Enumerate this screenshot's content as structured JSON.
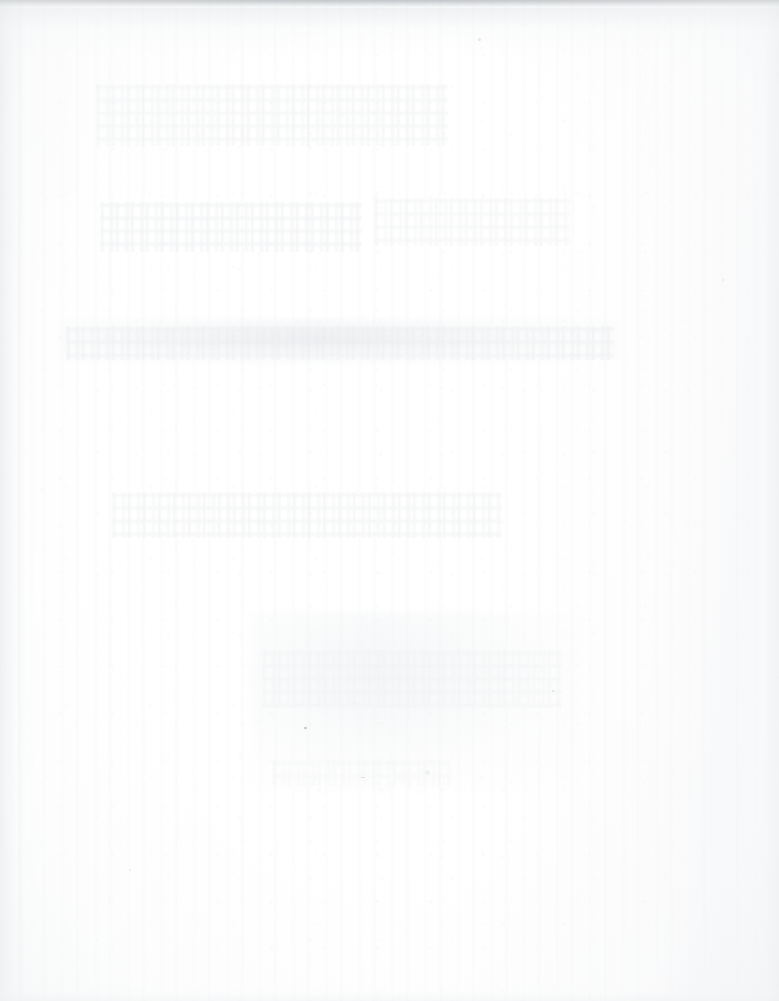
{
  "document": {
    "kind": "scanned-page",
    "page_state": "blank",
    "visible_text": "",
    "notes_visible_in_pixels": "No legible text, headings, numbers, captions, figures or page numbers are rendered anywhere on this page."
  },
  "canvas": {
    "width_px": 779,
    "height_px": 1001,
    "paper_color": "#ffffff",
    "base_tone": "#fdfdfd"
  },
  "scan_artifacts": {
    "top_edge_band": {
      "label": "top-edge-band",
      "color": "#b0b4b8",
      "height_px": 10
    },
    "bottom_edge_band": {
      "label": "bottom-edge-band",
      "color": "#eef0f1",
      "height_px": 14
    },
    "left_edge_shadow": {
      "label": "left-edge-shadow",
      "color": "#e4e7e9",
      "width_px": 22
    },
    "right_edge_shadow": {
      "label": "right-edge-shadow",
      "color": "#eaecee",
      "width_px": 26
    },
    "binding_gutter": {
      "label": "gutter-streak",
      "color": "#ecedef",
      "x_px": 18,
      "width_px": 16
    },
    "vertical_streaking": {
      "label": "vertical-streaks",
      "color": "#f0f2f3"
    },
    "paper_grain": {
      "label": "paper-grain",
      "color": "#eff1f2"
    }
  },
  "show_through": {
    "description": "Extremely faint illegible bleed-through from the reverse side of the sheet, visible as horizontal smudge bands.",
    "legible": false,
    "ink_color": "#e7eaec",
    "bands": [
      {
        "id": "ghost-a",
        "x": 96,
        "y": 84,
        "w": 352,
        "h": 62
      },
      {
        "id": "ghost-b",
        "x": 100,
        "y": 202,
        "w": 262,
        "h": 50
      },
      {
        "id": "ghost-c",
        "x": 374,
        "y": 198,
        "w": 196,
        "h": 48
      },
      {
        "id": "ghost-d",
        "x": 66,
        "y": 326,
        "w": 548,
        "h": 34
      },
      {
        "id": "ghost-e",
        "x": 112,
        "y": 492,
        "w": 390,
        "h": 46
      },
      {
        "id": "ghost-f",
        "x": 262,
        "y": 650,
        "w": 300,
        "h": 58
      },
      {
        "id": "ghost-g",
        "x": 272,
        "y": 760,
        "w": 180,
        "h": 26
      }
    ]
  },
  "specks": [
    {
      "id": "speck-1",
      "x": 304,
      "y": 727
    },
    {
      "id": "speck-2",
      "x": 361,
      "y": 777
    },
    {
      "id": "speck-3",
      "x": 552,
      "y": 690
    },
    {
      "id": "speck-4",
      "x": 425,
      "y": 771
    },
    {
      "id": "speck-5",
      "x": 129,
      "y": 869
    },
    {
      "id": "speck-6",
      "x": 478,
      "y": 38
    },
    {
      "id": "speck-7",
      "x": 722,
      "y": 279
    }
  ]
}
